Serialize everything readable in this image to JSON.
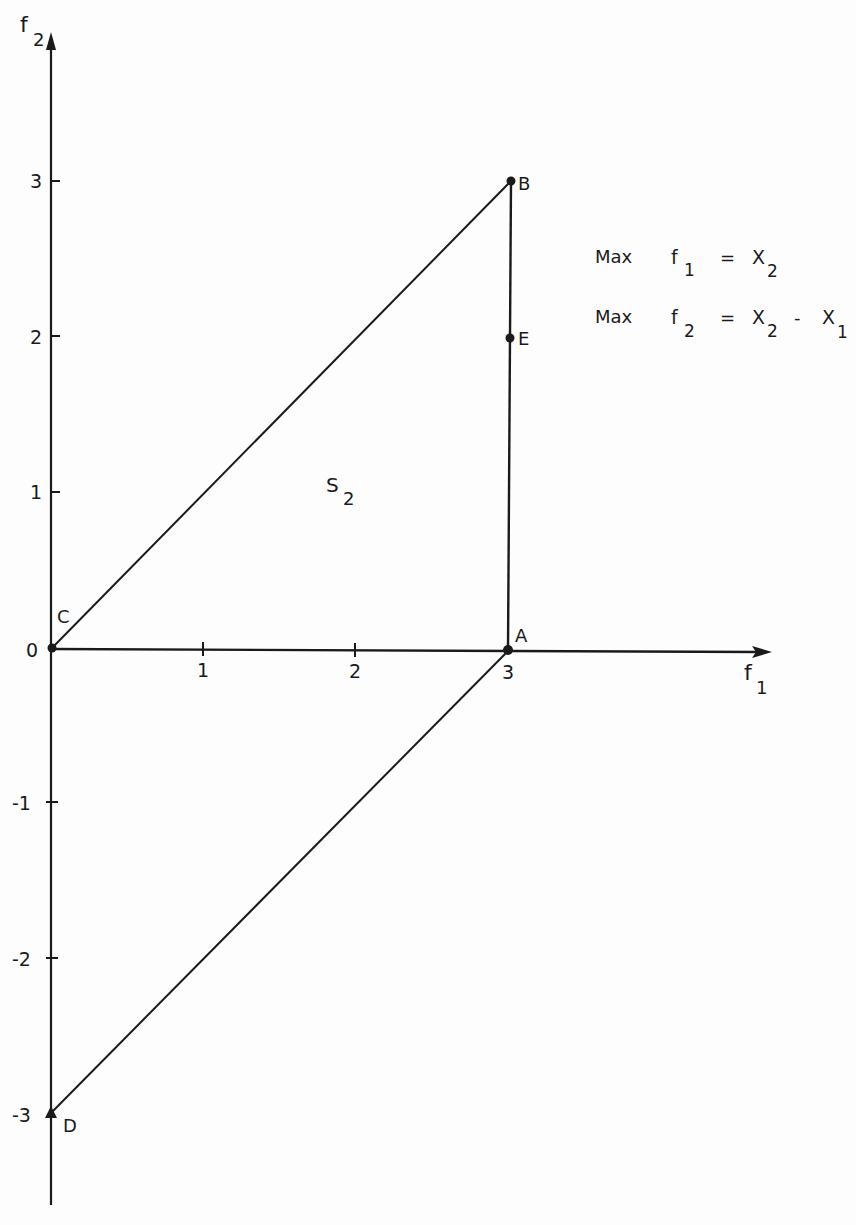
{
  "figure": {
    "axes": {
      "x_label": "f",
      "x_label_sub": "1",
      "y_label": "f",
      "y_label_sub": "2",
      "origin_label": "0",
      "x_ticks": [
        "1",
        "2",
        "3"
      ],
      "y_ticks_positive": [
        "1",
        "2",
        "3"
      ],
      "y_ticks_negative": [
        "-1",
        "-2",
        "-3"
      ]
    },
    "points": {
      "A": {
        "label": "A",
        "f1": 3,
        "f2": 0
      },
      "B": {
        "label": "B",
        "f1": 3,
        "f2": 3
      },
      "C": {
        "label": "C",
        "f1": 0,
        "f2": 0
      },
      "D": {
        "label": "D",
        "f1": 0,
        "f2": -3
      },
      "E": {
        "label": "E",
        "f1": 3,
        "f2": 2
      }
    },
    "region_label": "S",
    "region_label_sub": "2",
    "objectives": [
      {
        "keyword": "Max",
        "lhs": "f",
        "lhs_sub": "1",
        "eq": "=",
        "rhs1": "X",
        "rhs1_sub": "2",
        "op": "",
        "rhs2": "",
        "rhs2_sub": ""
      },
      {
        "keyword": "Max",
        "lhs": "f",
        "lhs_sub": "2",
        "eq": "=",
        "rhs1": "X",
        "rhs1_sub": "2",
        "op": "-",
        "rhs2": "X",
        "rhs2_sub": "1"
      }
    ],
    "segments": [
      [
        "C",
        "B"
      ],
      [
        "B",
        "A"
      ],
      [
        "A",
        "D"
      ]
    ]
  }
}
